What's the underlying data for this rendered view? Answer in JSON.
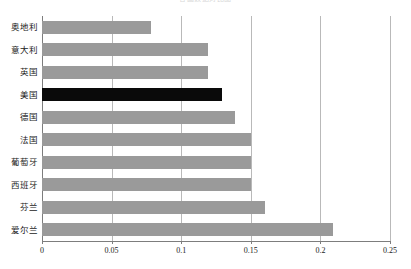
{
  "chart_data": {
    "type": "bar",
    "orientation": "horizontal",
    "title": "各国数据对比图",
    "xlabel": "",
    "ylabel": "",
    "categories": [
      "奥地利",
      "意大利",
      "英国",
      "美国",
      "德国",
      "法国",
      "葡萄牙",
      "西班牙",
      "芬兰",
      "爱尔兰"
    ],
    "values": [
      0.078,
      0.119,
      0.119,
      0.129,
      0.139,
      0.15,
      0.15,
      0.15,
      0.16,
      0.209
    ],
    "xlim": [
      0,
      0.25
    ],
    "xticks": [
      0,
      0.05,
      0.1,
      0.15,
      0.2,
      0.25
    ],
    "xticklabels": [
      "0",
      "0.05",
      "0.1",
      "0.15",
      "0.2",
      "0.25"
    ],
    "grid": "vertical",
    "legend": null,
    "highlight_category": "美国",
    "colors": {
      "bar": "#9a9a9a",
      "bar_highlight": "#0a0a0a",
      "gridline": "#b9b9b9",
      "axis": "#7d7d7d",
      "text": "#1a1a1a",
      "background": "#ffffff"
    }
  }
}
